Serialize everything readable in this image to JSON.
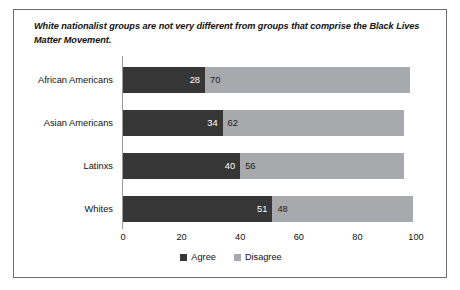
{
  "chart_data": {
    "type": "bar",
    "orientation": "horizontal",
    "stacked": true,
    "title": "White nationalist groups are not very different from groups that comprise the Black Lives Matter Movement.",
    "xlabel": "",
    "ylabel": "",
    "categories": [
      "African Americans",
      "Asian Americans",
      "Latinxs",
      "Whites"
    ],
    "series": [
      {
        "name": "Agree",
        "color": "#363636",
        "values": [
          28,
          34,
          40,
          51
        ]
      },
      {
        "name": "Disagree",
        "color": "#a8a9ad",
        "values": [
          70,
          62,
          56,
          48
        ]
      }
    ],
    "xlim": [
      0,
      100
    ],
    "xticks": [
      0,
      20,
      40,
      60,
      80,
      100
    ],
    "xtick_labels": [
      "0",
      "20",
      "40",
      "60",
      "80",
      "100"
    ],
    "grid": false,
    "legend_position": "bottom"
  },
  "rows": [
    {
      "category": "African Americans",
      "agree": 28,
      "disagree": 70,
      "agree_label": "28",
      "disagree_label": "70"
    },
    {
      "category": "Asian Americans",
      "agree": 34,
      "disagree": 62,
      "agree_label": "34",
      "disagree_label": "62"
    },
    {
      "category": "Latinxs",
      "agree": 40,
      "disagree": 56,
      "agree_label": "40",
      "disagree_label": "56"
    },
    {
      "category": "Whites",
      "agree": 51,
      "disagree": 48,
      "agree_label": "51",
      "disagree_label": "48"
    }
  ],
  "legend": [
    {
      "label": "Agree",
      "color": "#363636"
    },
    {
      "label": "Disagree",
      "color": "#a8a9ad"
    }
  ],
  "axis": {
    "ticks": [
      "0",
      "20",
      "40",
      "60",
      "80",
      "100"
    ]
  },
  "colors": {
    "agree": "#363636",
    "disagree": "#a8a9ad",
    "frame": "#6e6e6e",
    "text": "#111111",
    "background": "#ffffff"
  }
}
